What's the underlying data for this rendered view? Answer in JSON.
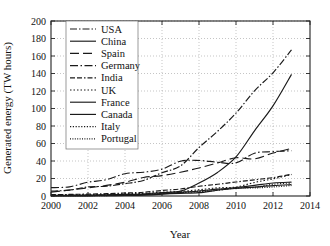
{
  "chart_data": {
    "type": "line",
    "title": "",
    "xlabel": "Year",
    "ylabel": "Generated energy (TW hours)",
    "xlim": [
      2000,
      2014
    ],
    "ylim": [
      0,
      200
    ],
    "xticks": [
      "2000",
      "2002",
      "2004",
      "2006",
      "2008",
      "2010",
      "2012",
      "2014"
    ],
    "yticks": [
      "0",
      "20",
      "40",
      "60",
      "80",
      "100",
      "120",
      "140",
      "160",
      "180",
      "200"
    ],
    "grid": true,
    "legend_position": "upper-left-inside",
    "x": [
      2000,
      2001,
      2002,
      2003,
      2004,
      2005,
      2006,
      2007,
      2008,
      2009,
      2010,
      2011,
      2012,
      2013
    ],
    "series": [
      {
        "name": "USA",
        "dash": "7,2,1.5,2",
        "values": [
          5.6,
          6.7,
          10.4,
          11.2,
          14.1,
          17.8,
          26.6,
          34.4,
          55.4,
          73.9,
          94.7,
          120.2,
          140.8,
          167.0
        ]
      },
      {
        "name": "China",
        "dash": "none",
        "values": [
          0.6,
          0.8,
          1.0,
          1.3,
          1.8,
          2.3,
          3.9,
          5.6,
          14.8,
          26.9,
          44.6,
          74.5,
          103.0,
          139.0
        ]
      },
      {
        "name": "Spain",
        "dash": "9,4",
        "values": [
          4.5,
          6.8,
          9.3,
          12.1,
          15.7,
          21.2,
          23.3,
          27.2,
          32.0,
          37.8,
          43.7,
          42.4,
          49.1,
          54.3
        ]
      },
      {
        "name": "Germany",
        "dash": "8,2.5,1.5,2.5",
        "values": [
          9.5,
          10.5,
          15.8,
          18.7,
          25.5,
          27.2,
          30.7,
          39.7,
          40.6,
          38.6,
          37.8,
          48.9,
          50.7,
          51.7
        ]
      },
      {
        "name": "India",
        "dash": "5,2,5,2,1.5,2",
        "values": [
          1.6,
          1.8,
          2.2,
          2.7,
          3.4,
          4.3,
          6.3,
          8.0,
          11.1,
          13.4,
          16.0,
          18.5,
          21.0,
          24.9
        ]
      },
      {
        "name": "UK",
        "dash": "1.5,2",
        "values": [
          0.9,
          1.0,
          1.3,
          1.9,
          2.7,
          3.0,
          4.2,
          5.3,
          7.1,
          9.3,
          10.2,
          15.5,
          19.6,
          24.5
        ]
      },
      {
        "name": "France",
        "dash": "none",
        "values": [
          0.1,
          0.15,
          0.2,
          0.3,
          0.6,
          1.0,
          2.2,
          4.0,
          5.7,
          7.8,
          9.7,
          12.1,
          14.9,
          15.9
        ]
      },
      {
        "name": "Canada",
        "dash": "none",
        "values": [
          0.3,
          0.4,
          0.5,
          0.8,
          1.0,
          1.6,
          2.4,
          3.0,
          3.8,
          6.6,
          8.6,
          10.2,
          11.8,
          13.0
        ]
      },
      {
        "name": "Italy",
        "dash": "1.2,1.6",
        "values": [
          0.6,
          1.2,
          1.4,
          1.5,
          1.8,
          2.3,
          3.0,
          4.0,
          4.9,
          6.5,
          9.1,
          9.9,
          13.4,
          14.9
        ]
      },
      {
        "name": "Portugal",
        "dash": "1,1.4",
        "values": [
          0.2,
          0.3,
          0.4,
          0.5,
          0.8,
          1.7,
          2.9,
          4.0,
          5.7,
          7.6,
          9.1,
          9.2,
          10.3,
          12.0
        ]
      }
    ]
  },
  "legend": {
    "items": [
      "USA",
      "China",
      "Spain",
      "Germany",
      "India",
      "UK",
      "France",
      "Canada",
      "Italy",
      "Portugal"
    ]
  },
  "colors": {
    "ink": "#1a1a1a",
    "grid": "#8a8a8a",
    "background": "#ffffff"
  }
}
